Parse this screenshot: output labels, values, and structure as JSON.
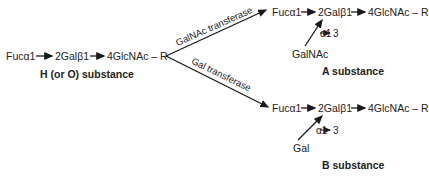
{
  "h_substance": {
    "chain": [
      "Fucα1",
      "2Galβ1",
      "4GlcNAc – R"
    ],
    "label": "H (or O) substance"
  },
  "branches": {
    "upper_enzyme": "GalNAc transferase",
    "lower_enzyme": "Gal transferase"
  },
  "a_substance": {
    "chain": [
      "Fucα1",
      "2Galβ1",
      "4GlcNAc – R"
    ],
    "added_sugar": "GalNAc",
    "linkage": [
      "α1",
      "3"
    ],
    "label": "A substance"
  },
  "b_substance": {
    "chain": [
      "Fucα1",
      "2Galβ1",
      "4GlcNAc – R"
    ],
    "added_sugar": "Gal",
    "linkage": [
      "α1",
      "3"
    ],
    "label": "B substance"
  },
  "colors": {
    "line": "#1a1a1a",
    "text": "#222222"
  }
}
